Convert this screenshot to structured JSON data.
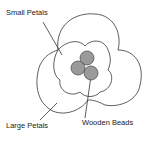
{
  "diagram": {
    "labels": {
      "small_petals": "Small Petals",
      "large_petals": "Large Petals",
      "wooden_beads": "Wooden Beads"
    },
    "colors": {
      "line": "#333333",
      "bead_fill": "#9a9a9a",
      "background": "#ffffff"
    }
  }
}
